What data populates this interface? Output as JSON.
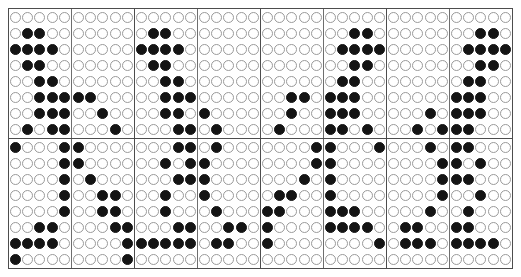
{
  "figure": {
    "rows": 16,
    "columns": 40,
    "block_rows": 2,
    "block_columns": 4,
    "rows_per_block": 8,
    "columns_per_block": 10,
    "columns_per_half_pane": 5,
    "colors": {
      "filled": "#141414",
      "empty_fill": "#ffffff",
      "empty_stroke": "#9a9a9a",
      "frame": "#4d4d4d",
      "inner_divider": "#6e6e6e",
      "background": "#ffffff"
    },
    "symbols": {
      "filled": "filled-circle",
      "empty": "empty-circle"
    }
  },
  "chart_data": {
    "type": "heatmap",
    "xlabel": "",
    "ylabel": "",
    "grid": true,
    "legend": "none",
    "value_map": {
      "0": "empty-circle",
      "1": "filled-circle"
    },
    "matrix": [
      [
        0,
        0,
        0,
        0,
        0,
        0,
        0,
        0,
        0,
        0,
        0,
        0,
        0,
        0,
        0,
        0,
        0,
        0,
        0,
        0,
        0,
        0,
        0,
        0,
        0,
        0,
        0,
        0,
        0,
        0,
        0,
        0,
        0,
        0,
        0,
        0,
        0,
        0,
        0,
        0
      ],
      [
        0,
        1,
        1,
        0,
        0,
        0,
        0,
        0,
        0,
        0,
        0,
        1,
        1,
        0,
        0,
        0,
        0,
        0,
        0,
        0,
        0,
        0,
        0,
        0,
        0,
        0,
        0,
        1,
        1,
        0,
        0,
        0,
        0,
        0,
        0,
        0,
        0,
        1,
        1,
        0
      ],
      [
        1,
        1,
        1,
        1,
        0,
        0,
        0,
        0,
        0,
        0,
        1,
        1,
        1,
        1,
        0,
        0,
        0,
        0,
        0,
        0,
        0,
        0,
        0,
        0,
        0,
        0,
        1,
        1,
        1,
        1,
        0,
        0,
        0,
        0,
        0,
        0,
        1,
        1,
        1,
        1
      ],
      [
        0,
        1,
        1,
        0,
        0,
        0,
        0,
        0,
        0,
        0,
        0,
        1,
        1,
        0,
        0,
        0,
        0,
        0,
        0,
        0,
        0,
        0,
        0,
        0,
        0,
        0,
        0,
        1,
        1,
        0,
        0,
        0,
        0,
        0,
        0,
        0,
        0,
        1,
        1,
        0
      ],
      [
        0,
        0,
        1,
        1,
        0,
        0,
        0,
        0,
        0,
        0,
        0,
        0,
        1,
        1,
        0,
        0,
        0,
        0,
        0,
        0,
        0,
        0,
        0,
        0,
        0,
        0,
        1,
        1,
        0,
        0,
        0,
        0,
        0,
        0,
        0,
        0,
        1,
        1,
        0,
        0
      ],
      [
        0,
        0,
        1,
        1,
        1,
        1,
        1,
        0,
        0,
        0,
        0,
        0,
        1,
        1,
        1,
        0,
        0,
        0,
        0,
        0,
        0,
        0,
        1,
        1,
        0,
        1,
        1,
        1,
        0,
        0,
        0,
        0,
        0,
        0,
        0,
        1,
        1,
        1,
        0,
        0
      ],
      [
        0,
        0,
        1,
        1,
        1,
        0,
        0,
        1,
        0,
        0,
        0,
        0,
        1,
        1,
        0,
        1,
        0,
        0,
        0,
        0,
        0,
        0,
        1,
        0,
        0,
        1,
        1,
        1,
        0,
        0,
        0,
        0,
        0,
        1,
        0,
        1,
        1,
        1,
        0,
        0
      ],
      [
        0,
        1,
        0,
        1,
        1,
        0,
        0,
        0,
        1,
        0,
        0,
        0,
        0,
        1,
        1,
        0,
        1,
        0,
        0,
        0,
        0,
        1,
        0,
        0,
        0,
        1,
        1,
        0,
        1,
        0,
        0,
        0,
        1,
        0,
        1,
        1,
        1,
        0,
        0,
        0
      ],
      [
        1,
        0,
        0,
        0,
        1,
        1,
        0,
        0,
        0,
        0,
        0,
        0,
        0,
        1,
        1,
        0,
        1,
        0,
        0,
        0,
        0,
        0,
        0,
        0,
        1,
        1,
        0,
        0,
        0,
        1,
        0,
        0,
        0,
        1,
        0,
        1,
        1,
        0,
        0,
        0
      ],
      [
        0,
        0,
        0,
        0,
        1,
        1,
        0,
        0,
        0,
        0,
        0,
        0,
        1,
        0,
        1,
        1,
        0,
        0,
        0,
        0,
        0,
        0,
        0,
        0,
        1,
        1,
        0,
        0,
        0,
        0,
        0,
        0,
        0,
        0,
        1,
        1,
        0,
        1,
        0,
        0
      ],
      [
        0,
        0,
        0,
        0,
        1,
        0,
        1,
        0,
        0,
        0,
        0,
        0,
        0,
        1,
        1,
        1,
        0,
        0,
        0,
        0,
        0,
        0,
        0,
        1,
        0,
        1,
        0,
        0,
        0,
        0,
        0,
        0,
        0,
        0,
        1,
        1,
        1,
        0,
        0,
        0
      ],
      [
        0,
        0,
        0,
        0,
        1,
        0,
        0,
        1,
        1,
        0,
        0,
        0,
        1,
        0,
        0,
        1,
        0,
        0,
        0,
        0,
        0,
        1,
        1,
        0,
        0,
        1,
        0,
        0,
        0,
        0,
        0,
        0,
        0,
        0,
        1,
        0,
        0,
        1,
        0,
        0
      ],
      [
        0,
        0,
        0,
        0,
        1,
        0,
        0,
        1,
        1,
        0,
        0,
        0,
        1,
        0,
        0,
        0,
        1,
        0,
        0,
        0,
        1,
        1,
        0,
        0,
        0,
        1,
        1,
        1,
        0,
        0,
        0,
        0,
        0,
        1,
        0,
        0,
        1,
        0,
        0,
        0
      ],
      [
        0,
        0,
        1,
        1,
        0,
        0,
        0,
        0,
        1,
        1,
        0,
        0,
        0,
        1,
        1,
        0,
        0,
        1,
        1,
        0,
        1,
        0,
        0,
        0,
        0,
        1,
        1,
        1,
        1,
        0,
        0,
        1,
        1,
        0,
        0,
        1,
        1,
        0,
        0,
        0
      ],
      [
        1,
        1,
        1,
        1,
        0,
        0,
        0,
        0,
        0,
        1,
        1,
        1,
        1,
        1,
        1,
        0,
        1,
        1,
        0,
        0,
        1,
        0,
        0,
        0,
        0,
        0,
        0,
        0,
        0,
        1,
        0,
        1,
        1,
        1,
        0,
        1,
        1,
        1,
        1,
        0
      ],
      [
        1,
        0,
        0,
        0,
        0,
        0,
        0,
        0,
        0,
        1,
        0,
        0,
        0,
        0,
        0,
        0,
        0,
        0,
        0,
        0,
        0,
        0,
        0,
        0,
        0,
        0,
        0,
        0,
        0,
        0,
        0,
        0,
        0,
        0,
        0,
        0,
        0,
        0,
        0,
        0
      ]
    ]
  }
}
